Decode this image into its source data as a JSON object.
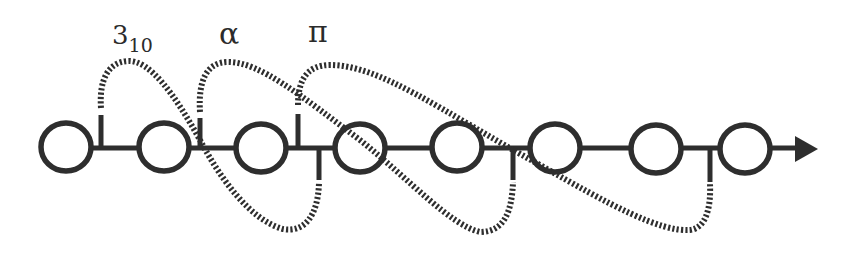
{
  "diagram": {
    "labels": [
      {
        "id": "helix-3-10",
        "main": "3",
        "sub": "10",
        "x": 112,
        "y": 44
      },
      {
        "id": "helix-alpha",
        "main": "α",
        "x": 219,
        "y": 44
      },
      {
        "id": "helix-pi",
        "main": "π",
        "x": 316,
        "y": 42
      }
    ],
    "backbone": {
      "y": 148,
      "x_start": 41,
      "x_end": 818,
      "direction": "right-arrow"
    },
    "residues_count": 8,
    "residue_centers_x": [
      66,
      164,
      261,
      360,
      457,
      555,
      666,
      744
    ],
    "carbonyl_ticks_up_x": [
      101,
      200,
      298
    ],
    "nh_ticks_down_x": [
      319,
      513,
      710
    ],
    "hydrogen_bonds": [
      {
        "helix": "3-10",
        "from_residue": 1,
        "to_residue": 4,
        "style": "dotted"
      },
      {
        "helix": "alpha",
        "from_residue": 2,
        "to_residue": 6,
        "style": "dotted"
      },
      {
        "helix": "pi",
        "from_residue": 3,
        "to_residue": 8,
        "style": "dotted"
      }
    ],
    "colors": {
      "stroke": "#2e2e2e",
      "background": "#ffffff"
    }
  }
}
